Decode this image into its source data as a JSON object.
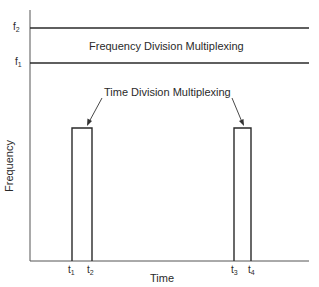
{
  "diagram": {
    "axes": {
      "x_label": "Time",
      "y_label": "Frequency"
    },
    "frequency_marks": [
      {
        "base": "f",
        "sub": "2"
      },
      {
        "base": "f",
        "sub": "1"
      }
    ],
    "time_marks": [
      {
        "base": "t",
        "sub": "1"
      },
      {
        "base": "t",
        "sub": "2"
      },
      {
        "base": "t",
        "sub": "3"
      },
      {
        "base": "t",
        "sub": "4"
      }
    ],
    "labels": {
      "fdm": "Frequency Division Multiplexing",
      "tdm": "Time Division Multiplexing"
    },
    "colors": {
      "line": "#2a2a2a",
      "background": "#ffffff"
    }
  }
}
